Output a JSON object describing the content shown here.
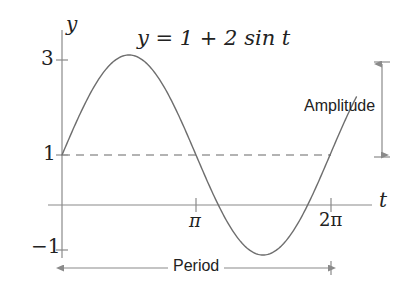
{
  "figure": {
    "title_equation": "y = 1 + 2 sin t",
    "axis_labels": {
      "y": "y",
      "t": "t"
    },
    "y_ticks": [
      {
        "value": 3,
        "label": "3"
      },
      {
        "value": 1,
        "label": "1"
      },
      {
        "value": -1,
        "label": "−1"
      }
    ],
    "t_ticks": [
      {
        "value": 3.14159,
        "label": "π"
      },
      {
        "value": 6.28319,
        "label": "2π"
      }
    ],
    "annotations": {
      "amplitude": "Amplitude",
      "period": "Period"
    },
    "colors": {
      "curve": "#6e6e6e",
      "axis": "#8a8a8a",
      "dashed_midline": "#9a9a9a",
      "annotation": "#7a7a7a",
      "text": "#222222",
      "background": "#ffffff"
    }
  },
  "chart_data": {
    "type": "line",
    "title": "y = 1 + 2 sin t",
    "xlabel": "t",
    "ylabel": "y",
    "xlim": [
      0,
      6.28319
    ],
    "ylim": [
      -1.45,
      3.35
    ],
    "grid": false,
    "legend": null,
    "function": "y = 1 + 2*sin(t)",
    "amplitude": 2,
    "midline": 1,
    "period": 6.28319,
    "maximum": {
      "t": 1.5708,
      "y": 3
    },
    "minimum": {
      "t": 4.71239,
      "y": -1
    },
    "xtick_values": [
      3.14159,
      6.28319
    ],
    "xtick_labels": [
      "π",
      "2π"
    ],
    "ytick_values": [
      3,
      1,
      -1
    ],
    "ytick_labels": [
      "3",
      "1",
      "−1"
    ],
    "series": [
      {
        "name": "y = 1 + 2 sin t",
        "x": [
          0,
          0.3927,
          0.7854,
          1.1781,
          1.5708,
          1.9635,
          2.3562,
          2.7489,
          3.14159,
          3.5343,
          3.927,
          4.3197,
          4.71239,
          5.1051,
          5.4978,
          5.8905,
          6.28319
        ],
        "y": [
          1,
          1.765,
          2.414,
          2.848,
          3,
          2.848,
          2.414,
          1.765,
          1,
          0.235,
          -0.414,
          -0.848,
          -1,
          -0.848,
          -0.414,
          0.235,
          1
        ]
      }
    ],
    "annotations": [
      {
        "text": "Amplitude",
        "type": "double-arrow-vertical",
        "from_y": 1,
        "to_y": 3
      },
      {
        "text": "Period",
        "type": "double-arrow-horizontal",
        "from_t": 0,
        "to_t": 6.28319
      },
      {
        "text": "y = 1 + 2 sin t",
        "type": "equation-label"
      }
    ]
  }
}
